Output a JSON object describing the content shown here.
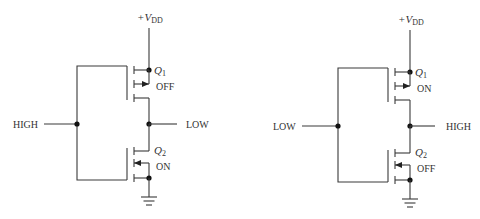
{
  "diagram": {
    "type": "CMOS inverter operation",
    "circuits": [
      {
        "id": "left",
        "supply_label_prefix": "+V",
        "supply_label_sub": "DD",
        "input_label": "HIGH",
        "output_label": "LOW",
        "q1": {
          "name": "Q",
          "sub": "1",
          "state": "OFF",
          "type": "PMOS"
        },
        "q2": {
          "name": "Q",
          "sub": "2",
          "state": "ON",
          "type": "NMOS"
        }
      },
      {
        "id": "right",
        "supply_label_prefix": "+V",
        "supply_label_sub": "DD",
        "input_label": "LOW",
        "output_label": "HIGH",
        "q1": {
          "name": "Q",
          "sub": "1",
          "state": "ON",
          "type": "PMOS"
        },
        "q2": {
          "name": "Q",
          "sub": "2",
          "state": "OFF",
          "type": "NMOS"
        }
      }
    ],
    "colors": {
      "wire": "#3a3a3a",
      "text": "#333333",
      "background": "#ffffff"
    }
  }
}
